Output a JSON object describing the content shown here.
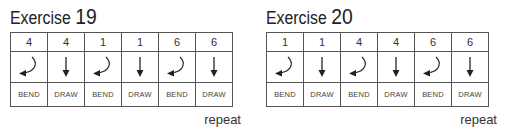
{
  "exercises": [
    {
      "title_word": "Exercise",
      "number": "19",
      "columns": [
        {
          "hole": "4",
          "action": "BEND",
          "arrow": "bend"
        },
        {
          "hole": "4",
          "action": "DRAW",
          "arrow": "draw"
        },
        {
          "hole": "1",
          "action": "BEND",
          "arrow": "bend"
        },
        {
          "hole": "1",
          "action": "DRAW",
          "arrow": "draw"
        },
        {
          "hole": "6",
          "action": "BEND",
          "arrow": "bend"
        },
        {
          "hole": "6",
          "action": "DRAW",
          "arrow": "draw"
        }
      ],
      "footer": "repeat"
    },
    {
      "title_word": "Exercise",
      "number": "20",
      "columns": [
        {
          "hole": "1",
          "action": "BEND",
          "arrow": "bend"
        },
        {
          "hole": "1",
          "action": "DRAW",
          "arrow": "draw"
        },
        {
          "hole": "4",
          "action": "BEND",
          "arrow": "bend"
        },
        {
          "hole": "4",
          "action": "DRAW",
          "arrow": "draw"
        },
        {
          "hole": "6",
          "action": "BEND",
          "arrow": "bend"
        },
        {
          "hole": "6",
          "action": "DRAW",
          "arrow": "draw"
        }
      ],
      "footer": "repeat"
    }
  ],
  "icons": {
    "bend": "curved-arrow-down-left-icon",
    "draw": "arrow-down-icon"
  }
}
